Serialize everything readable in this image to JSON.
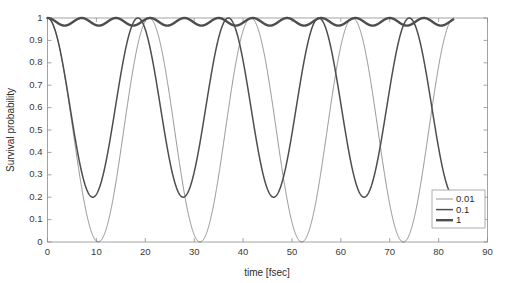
{
  "chart_data": {
    "type": "line",
    "title": "",
    "xlabel": "time [fsec]",
    "ylabel": "Survival probability",
    "xlim": [
      0,
      90
    ],
    "ylim": [
      0,
      1
    ],
    "xticks": [
      0,
      10,
      20,
      30,
      40,
      50,
      60,
      70,
      80,
      90
    ],
    "xtick_labels": [
      "0",
      "10",
      "20",
      "30",
      "40",
      "50",
      "60",
      "70",
      "80",
      "90"
    ],
    "yticks": [
      0,
      0.1,
      0.2,
      0.3,
      0.4,
      0.5,
      0.6,
      0.7,
      0.8,
      0.9,
      1
    ],
    "ytick_labels": [
      "0",
      "0.1",
      "0.2",
      "0.3",
      "0.4",
      "0.5",
      "0.6",
      "0.7",
      "0.8",
      "0.9",
      "1"
    ],
    "grid": false,
    "legend_position": "lower right",
    "legend_title": "",
    "x_data_range": [
      0,
      83
    ],
    "series": [
      {
        "name": "0.01",
        "label": "0.01",
        "color": "#4d4d4d",
        "line_width": 0.6,
        "model": "cosine",
        "amplitude": 0.5,
        "offset": 0.5,
        "period": 20.8,
        "phase": 0,
        "minimum_value": 0.0,
        "maximum_value": 1.0,
        "minima_times": [
          10.4,
          31.2,
          52.0,
          72.8
        ],
        "maxima_times": [
          0,
          20.8,
          41.6,
          62.4,
          83.2
        ]
      },
      {
        "name": "0.1",
        "label": "0.1",
        "color": "#4d4d4d",
        "line_width": 1.5,
        "model": "cosine",
        "amplitude": 0.4,
        "offset": 0.6,
        "period": 18.5,
        "phase": 0,
        "minimum_value": 0.2,
        "maximum_value": 1.0,
        "minima_times": [
          9.25,
          27.75,
          46.25,
          64.75
        ],
        "maxima_times": [
          0,
          18.5,
          37.0,
          55.5,
          74.0
        ]
      },
      {
        "name": "1",
        "label": "1",
        "color": "#333333",
        "line_width": 2.4,
        "model": "cosine",
        "amplitude": 0.017,
        "offset": 0.983,
        "period": 7.0,
        "phase": 0,
        "minimum_value": 0.966,
        "maximum_value": 1.0,
        "minima_times": [
          3.5,
          10.5,
          17.5,
          24.5,
          31.5,
          38.5,
          45.5,
          52.5,
          59.5,
          66.5,
          73.5,
          80.5
        ],
        "maxima_times": [
          0,
          7,
          14,
          21,
          28,
          35,
          42,
          49,
          56,
          63,
          70,
          77
        ]
      }
    ]
  },
  "figure": {
    "background_color": "#ffffff",
    "axis_color": "#8c8c8c",
    "text_color": "#2b2b2b"
  }
}
